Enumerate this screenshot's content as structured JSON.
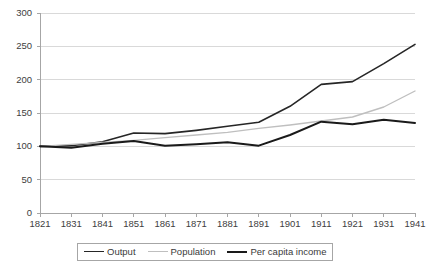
{
  "chart_data": {
    "type": "line",
    "title": "",
    "subtitle": "",
    "xlabel": "",
    "ylabel": "",
    "grid": true,
    "legend_position": "bottom",
    "ylim": [
      0,
      300
    ],
    "ytick_step": 50,
    "yticks": [
      "0",
      "50",
      "100",
      "150",
      "200",
      "250",
      "300"
    ],
    "categories": [
      "1821",
      "1831",
      "1841",
      "1851",
      "1861",
      "1871",
      "1881",
      "1891",
      "1901",
      "1911",
      "1921",
      "1931",
      "1941"
    ],
    "series": [
      {
        "name": "Output",
        "color": "#262626",
        "width": 1.6,
        "values": [
          100,
          101,
          107,
          120,
          119,
          124,
          130,
          136,
          160,
          193,
          197,
          224,
          253
        ]
      },
      {
        "name": "Population",
        "color": "#bfbfbf",
        "width": 1.4,
        "values": [
          100,
          103,
          106,
          109,
          113,
          117,
          121,
          127,
          132,
          138,
          144,
          159,
          183
        ]
      },
      {
        "name": "Per capita income",
        "color": "#1a1a1a",
        "width": 2.0,
        "values": [
          100,
          98,
          104,
          108,
          101,
          103,
          106,
          101,
          117,
          137,
          133,
          140,
          135
        ]
      }
    ]
  },
  "axes": {
    "axis_line_color": "#a6a6a6",
    "grid_color": "#d9d9d9",
    "tick_color": "#a6a6a6"
  },
  "legend": {
    "border_color": "#a6a6a6",
    "items": [
      {
        "label": "Output",
        "color": "#262626",
        "width": 1.6
      },
      {
        "label": "Population",
        "color": "#bfbfbf",
        "width": 1.4
      },
      {
        "label": "Per capita income",
        "color": "#1a1a1a",
        "width": 2.0
      }
    ]
  }
}
